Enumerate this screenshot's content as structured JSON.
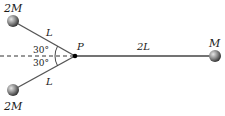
{
  "diagram": {
    "pivot": {
      "label": "P"
    },
    "upper_mass": {
      "label": "2M",
      "rod_label": "L",
      "angle_label": "30°"
    },
    "lower_mass": {
      "label": "2M",
      "rod_label": "L",
      "angle_label": "30°"
    },
    "right_mass": {
      "label": "M",
      "rod_label": "2L"
    }
  },
  "colors": {
    "rod": "#555555",
    "ball": "#8a8a8a",
    "pivot": "#000000",
    "dashed": "#333333"
  }
}
